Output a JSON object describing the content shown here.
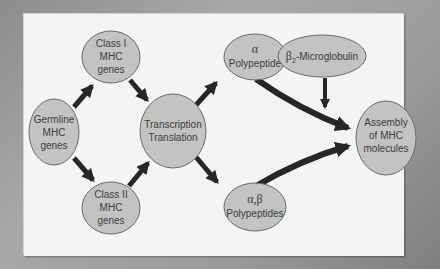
{
  "diagram": {
    "colors": {
      "background": "#9a9a9a",
      "panel": "#f4f4f4",
      "node_fill": "#c3c3c3",
      "node_stroke": "#6a6a6a",
      "arrow": "#262626",
      "text": "#3c3c3c"
    },
    "nodes": {
      "germline": {
        "line1": "Germline",
        "line2": "MHC",
        "line3": "genes"
      },
      "class1": {
        "line1": "Class I",
        "line2": "MHC",
        "line3": "genes"
      },
      "class2": {
        "line1": "Class II",
        "line2": "MHC",
        "line3": "genes"
      },
      "transcription": {
        "line1": "Transcription",
        "line2": "Translation"
      },
      "alpha": {
        "symbol": "α",
        "label": "Polypeptide"
      },
      "b2m": {
        "symbol": "β",
        "subscript": "2",
        "label": "-Microglobulin"
      },
      "alphabeta": {
        "symbol": "α,β",
        "label": "Polypeptides"
      },
      "assembly": {
        "line1": "Assembly",
        "line2": "of MHC",
        "line3": "molecules"
      }
    },
    "edges": [
      {
        "from": "Germline MHC genes",
        "to": "Class I MHC genes"
      },
      {
        "from": "Germline MHC genes",
        "to": "Class II MHC genes"
      },
      {
        "from": "Class I MHC genes",
        "to": "Transcription Translation"
      },
      {
        "from": "Class II MHC genes",
        "to": "Transcription Translation"
      },
      {
        "from": "Transcription Translation",
        "to": "α Polypeptide"
      },
      {
        "from": "Transcription Translation",
        "to": "α,β Polypeptides"
      },
      {
        "from": "α Polypeptide",
        "to": "Assembly of MHC molecules"
      },
      {
        "from": "β2-Microglobulin",
        "to": "Assembly of MHC molecules"
      },
      {
        "from": "α,β Polypeptides",
        "to": "Assembly of MHC molecules"
      }
    ]
  }
}
